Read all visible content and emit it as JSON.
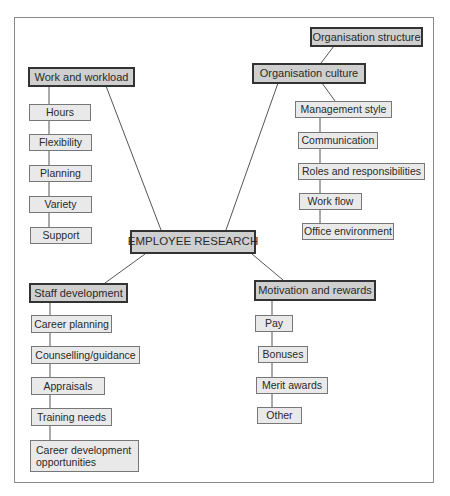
{
  "diagram": {
    "center": "EMPLOYEE RESEARCH",
    "branches": [
      {
        "label": "Work and workload",
        "items": [
          "Hours",
          "Flexibility",
          "Planning",
          "Variety",
          "Support"
        ]
      },
      {
        "label": "Organisation culture",
        "parent_note": "Organisation structure",
        "items": [
          "Management style",
          "Communication",
          "Roles and responsibilities",
          "Work flow",
          "Office environment"
        ]
      },
      {
        "label": "Staff development",
        "items": [
          "Career planning",
          "Counselling/guidance",
          "Appraisals",
          "Training needs",
          "Career development opportunities"
        ]
      },
      {
        "label": "Motivation and rewards",
        "items": [
          "Pay",
          "Bonuses",
          "Merit awards",
          "Other"
        ]
      }
    ]
  },
  "colors": {
    "main_box_fill": "#cfcfcf",
    "sub_box_fill": "#e9e9e9",
    "border": "#333333",
    "line": "#555555"
  }
}
